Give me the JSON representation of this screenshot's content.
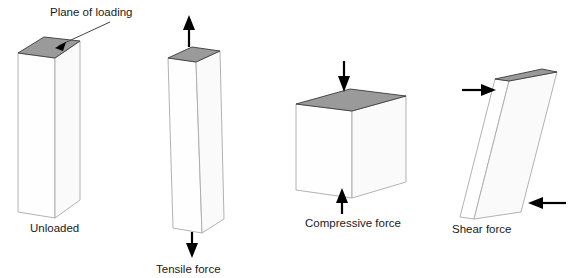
{
  "figure": {
    "title_visible": false,
    "background_color": "#ffffff",
    "stroke_color": "#a9a9a9",
    "loading_plane_color": "#9a9a9a",
    "arrow_color": "#000000",
    "text_color": "#1a1a1a"
  },
  "annotations": {
    "plane_of_loading": "Plane of loading"
  },
  "panels": [
    {
      "id": "unloaded",
      "label": "Unloaded",
      "shape": "tall-rectangular-prism",
      "loading_plane_shaded": true,
      "arrows": []
    },
    {
      "id": "tensile",
      "label": "Tensile force",
      "shape": "tall-rectangular-prism",
      "loading_plane_shaded": true,
      "arrows": [
        "up-arrow-above-block",
        "down-arrow-below-block"
      ]
    },
    {
      "id": "compressive",
      "label": "Compressive force",
      "shape": "short-rectangular-prism",
      "loading_plane_shaded": true,
      "arrows": [
        "down-arrow-above-block",
        "up-arrow-below-block"
      ]
    },
    {
      "id": "shear",
      "label": "Shear force",
      "shape": "sheared-parallelepiped",
      "loading_plane_shaded": true,
      "arrows": [
        "right-arrow-upper-left",
        "left-arrow-lower-right"
      ]
    }
  ]
}
